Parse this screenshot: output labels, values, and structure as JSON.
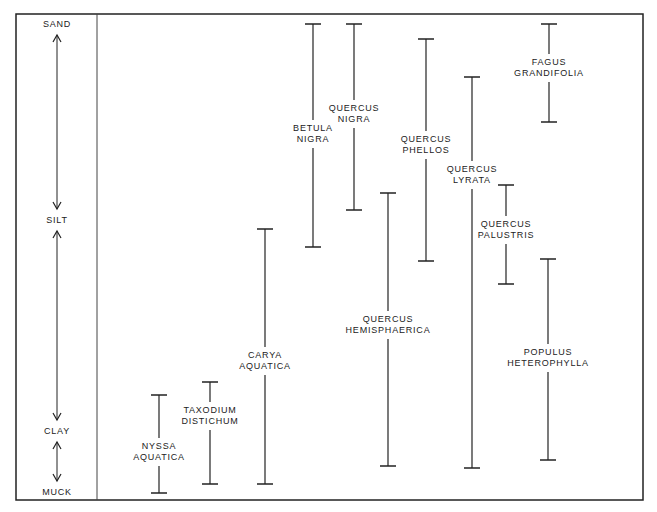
{
  "chart_data": {
    "type": "range",
    "title": "",
    "ylabel": "Soil texture",
    "axis_levels": [
      {
        "label": "SAND",
        "y": 24
      },
      {
        "label": "SILT",
        "y": 220
      },
      {
        "label": "CLAY",
        "y": 431
      },
      {
        "label": "MUCK",
        "y": 492
      }
    ],
    "axis_scale": [
      "SAND",
      "SILT",
      "CLAY",
      "MUCK"
    ],
    "series": [
      {
        "name": "NYSSA AQUATICA",
        "lines": [
          "NYSSA",
          "AQUATICA"
        ],
        "x": 159,
        "top": 395,
        "bottom": 493,
        "label_y": 452,
        "range": [
          "CLAY",
          "MUCK"
        ]
      },
      {
        "name": "TAXODIUM DISTICHUM",
        "lines": [
          "TAXODIUM",
          "DISTICHUM"
        ],
        "x": 210,
        "top": 382,
        "bottom": 484,
        "label_y": 416,
        "range": [
          "CLAY",
          "MUCK"
        ]
      },
      {
        "name": "CARYA AQUATICA",
        "lines": [
          "CARYA",
          "AQUATICA"
        ],
        "x": 265,
        "top": 229,
        "bottom": 484,
        "label_y": 361,
        "range": [
          "SILT",
          "MUCK"
        ]
      },
      {
        "name": "BETULA NIGRA",
        "lines": [
          "BETULA",
          "NIGRA"
        ],
        "x": 313,
        "top": 24,
        "bottom": 247,
        "label_y": 134,
        "range": [
          "SAND",
          "SILT"
        ]
      },
      {
        "name": "QUERCUS NIGRA",
        "lines": [
          "QUERCUS",
          "NIGRA"
        ],
        "x": 354,
        "top": 24,
        "bottom": 210,
        "label_y": 114,
        "range": [
          "SAND",
          "SILT"
        ]
      },
      {
        "name": "QUERCUS HEMISPHAERICA",
        "lines": [
          "QUERCUS",
          "HEMISPHAERICA"
        ],
        "x": 388,
        "top": 193,
        "bottom": 466,
        "label_y": 325,
        "range": [
          "SILT",
          "CLAY"
        ]
      },
      {
        "name": "QUERCUS PHELLOS",
        "lines": [
          "QUERCUS",
          "PHELLOS"
        ],
        "x": 426,
        "top": 39,
        "bottom": 261,
        "label_y": 145,
        "range": [
          "SAND",
          "SILT"
        ]
      },
      {
        "name": "QUERCUS LYRATA",
        "lines": [
          "QUERCUS",
          "LYRATA"
        ],
        "x": 472,
        "top": 77,
        "bottom": 468,
        "label_y": 175,
        "range": [
          "SAND",
          "CLAY"
        ]
      },
      {
        "name": "QUERCUS PALUSTRIS",
        "lines": [
          "QUERCUS",
          "PALUSTRIS"
        ],
        "x": 506,
        "top": 185,
        "bottom": 284,
        "label_y": 230,
        "range": [
          "SILT",
          "SILT"
        ]
      },
      {
        "name": "FAGUS GRANDIFOLIA",
        "lines": [
          "FAGUS",
          "GRANDIFOLIA"
        ],
        "x": 549,
        "top": 24,
        "bottom": 122,
        "label_y": 68,
        "range": [
          "SAND",
          "SAND"
        ]
      },
      {
        "name": "POPULUS HETEROPHYLLA",
        "lines": [
          "POPULUS",
          "HETEROPHYLLA"
        ],
        "x": 548,
        "top": 259,
        "bottom": 460,
        "label_y": 358,
        "range": [
          "SILT",
          "CLAY"
        ]
      }
    ],
    "legend": null,
    "grid": false
  }
}
